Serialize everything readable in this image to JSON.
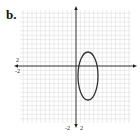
{
  "panel_label": "b.",
  "chart_data": {
    "type": "scatter",
    "title": "",
    "xlabel": "",
    "ylabel": "",
    "grid": true,
    "xlim": [
      -12,
      13
    ],
    "ylim": [
      -13,
      13
    ],
    "tick_labels": {
      "x": [
        "-2",
        "2"
      ],
      "y": [
        "2",
        "-2"
      ]
    },
    "shapes": [
      {
        "kind": "ellipse",
        "center": [
          2.7,
          -2.3
        ],
        "rx": 2.3,
        "ry": 5.5,
        "color": "#333333"
      }
    ],
    "colors": {
      "grid": "#d9d9d9",
      "axis": "#222222",
      "curve": "#333333"
    }
  }
}
